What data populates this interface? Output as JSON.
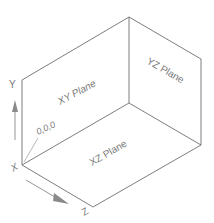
{
  "diagram": {
    "planes": {
      "xy": "XY Plane",
      "yz": "YZ Plane",
      "xz": "XZ Plane"
    },
    "origin_label": "0,0,0",
    "axes": {
      "x": "X",
      "y": "Y",
      "z": "Z"
    },
    "colors": {
      "line": "#6e6e6e",
      "text": "#7a7a7a",
      "arrow": "#8a8a8a"
    }
  }
}
